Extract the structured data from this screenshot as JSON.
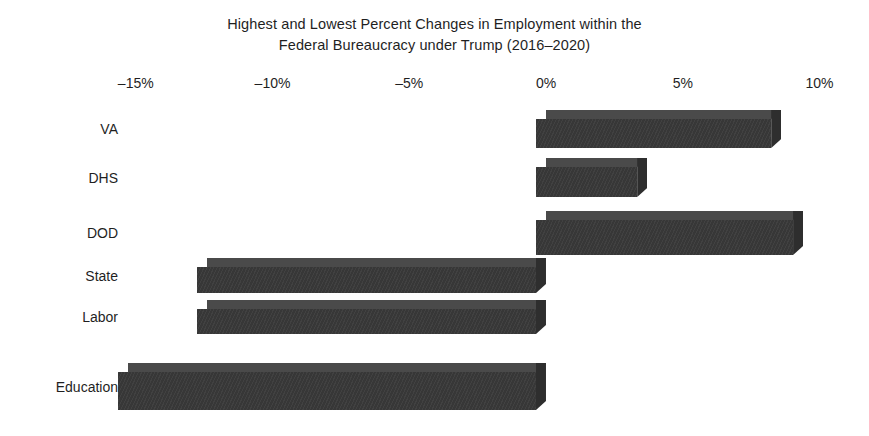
{
  "chart_data": {
    "type": "bar",
    "orientation": "horizontal",
    "title": "Highest and Lowest Percent Changes in Employment within the\nFederal Bureaucracy under Trump (2016–2020)",
    "title_line1": "Highest and Lowest Percent Changes in Employment within the",
    "title_line2": "Federal Bureaucracy under Trump (2016–2020)",
    "xlabel": "",
    "ylabel": "",
    "categories": [
      "VA",
      "DHS",
      "DOD",
      "State",
      "Labor",
      "Education"
    ],
    "values": [
      8.6,
      3.7,
      9.4,
      -12.4,
      -12.4,
      -15.3
    ],
    "value_labels": [
      "8.6%",
      "3.7%",
      "9.4%",
      "-12.4%",
      "-12.4%",
      "-15.3%"
    ],
    "xlim": [
      -16.5,
      11.0
    ],
    "xticks": [
      -15,
      -10,
      -5,
      0,
      5,
      10
    ],
    "xtick_labels": [
      "–15%",
      "–10%",
      "–5%",
      "0%",
      "5%",
      "10%"
    ],
    "grid": false,
    "legend": null,
    "bar_color": "#3a3a3a",
    "bar_top_color": "#4a4a4a",
    "bar_side_color": "#2e2e2e",
    "background_color": "#ffffff",
    "style": "3d-shaded-bars",
    "series": [
      {
        "name": "Percent change in employment",
        "values": [
          8.6,
          3.7,
          9.4,
          -12.4,
          -12.4,
          -15.3
        ]
      }
    ]
  },
  "axis": {
    "ticks": [
      {
        "label": "–15%",
        "value": -15
      },
      {
        "label": "–10%",
        "value": -10
      },
      {
        "label": "–5%",
        "value": -5
      },
      {
        "label": "0%",
        "value": 0
      },
      {
        "label": "5%",
        "value": 5
      },
      {
        "label": "10%",
        "value": 10
      }
    ]
  },
  "rows": [
    {
      "label": "VA",
      "value": 8.6
    },
    {
      "label": "DHS",
      "value": 3.7
    },
    {
      "label": "DOD",
      "value": 9.4
    },
    {
      "label": "State",
      "value": -12.4
    },
    {
      "label": "Labor",
      "value": -12.4
    },
    {
      "label": "Education",
      "value": -15.3
    }
  ]
}
